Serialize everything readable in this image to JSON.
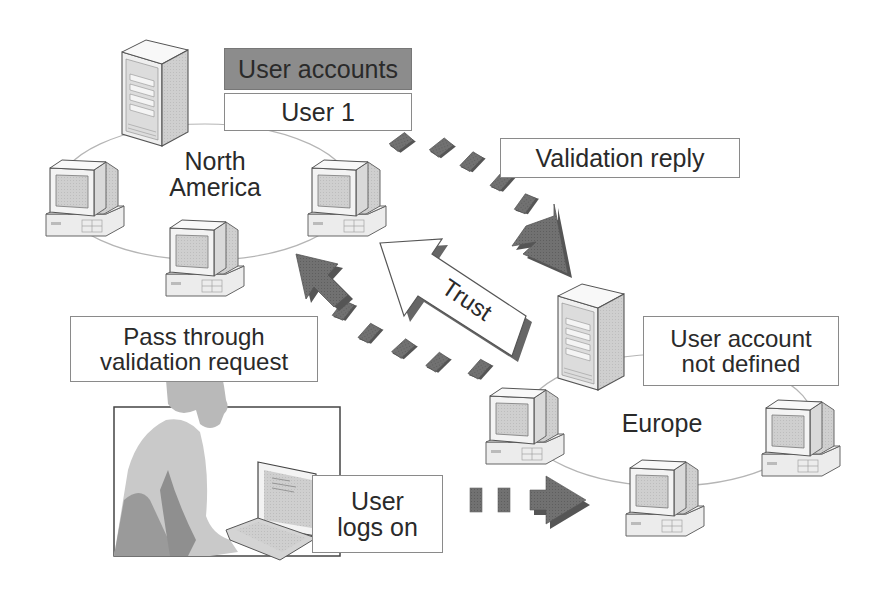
{
  "diagram": {
    "regions": {
      "north_america": {
        "line1": "North",
        "line2": "America"
      },
      "europe": {
        "label": "Europe"
      }
    },
    "labels": {
      "user_accounts_header": "User accounts",
      "user_1": "User 1",
      "validation_reply": "Validation reply",
      "trust": "Trust",
      "pass_through": {
        "line1": "Pass through",
        "line2": "validation request"
      },
      "user_account_not_defined": {
        "line1": "User account",
        "line2": "not defined"
      },
      "user_logs_on": {
        "line1": "User",
        "line2": "logs on"
      }
    },
    "nodes": [
      {
        "id": "na-server",
        "type": "server-icon",
        "region": "north_america"
      },
      {
        "id": "na-workstation-left",
        "type": "workstation-icon",
        "region": "north_america"
      },
      {
        "id": "na-workstation-bottom",
        "type": "workstation-icon",
        "region": "north_america"
      },
      {
        "id": "na-workstation-right",
        "type": "workstation-icon",
        "region": "north_america"
      },
      {
        "id": "eu-server",
        "type": "server-icon",
        "region": "europe"
      },
      {
        "id": "eu-workstation-left",
        "type": "workstation-icon",
        "region": "europe"
      },
      {
        "id": "eu-workstation-bottom",
        "type": "workstation-icon",
        "region": "europe"
      },
      {
        "id": "eu-workstation-right",
        "type": "workstation-icon",
        "region": "europe"
      },
      {
        "id": "user-at-laptop",
        "type": "person-laptop-illustration"
      }
    ],
    "flows": [
      {
        "from": "user-at-laptop",
        "to": "eu-workstation-bottom",
        "style": "dashed-dark-arrow",
        "label": "User logs on"
      },
      {
        "from": "europe",
        "to": "north_america",
        "style": "dashed-dark-arrow",
        "label": "Pass through validation request"
      },
      {
        "from": "north_america",
        "to": "eu-server",
        "style": "dashed-dark-arrow",
        "label": "Validation reply"
      },
      {
        "from": "europe",
        "to": "north_america",
        "style": "outline-arrow",
        "label": "Trust"
      }
    ],
    "colors": {
      "dark_fill": "#6f6f6f",
      "mid_fill": "#a8a8a8",
      "light_fill": "#d4d4d4",
      "outline": "#555555",
      "ring": "#b5b5b5"
    }
  }
}
